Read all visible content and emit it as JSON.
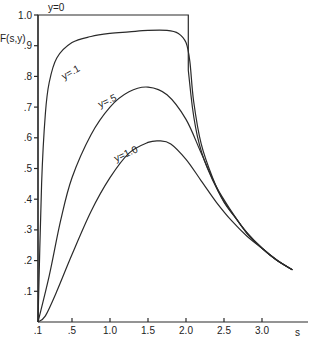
{
  "chart_data": {
    "type": "line",
    "title": "",
    "xlabel": "s",
    "ylabel": "F(s,y)",
    "xlim": [
      0.05,
      3.5
    ],
    "ylim": [
      0,
      1.0
    ],
    "grid": false,
    "legend": "inline curve labels",
    "x_ticks": [
      ".1",
      ".5",
      "1.0",
      "1.5",
      "2.0",
      "2.5",
      "3.0"
    ],
    "x_tick_values": [
      0.05,
      0.5,
      1.0,
      1.5,
      2.0,
      2.5,
      3.0
    ],
    "y_ticks": [
      ".1",
      ".2",
      ".3",
      ".4",
      ".5",
      ".6",
      ".7",
      ".8",
      ".9",
      "1.0"
    ],
    "y_tick_values": [
      0.1,
      0.2,
      0.3,
      0.4,
      0.5,
      0.6,
      0.7,
      0.8,
      0.9,
      1.0
    ],
    "series": [
      {
        "name": "y=0",
        "label": "y=0",
        "x": [
          0.05,
          0.05,
          2.03,
          2.03,
          2.1,
          2.2,
          2.35,
          2.5,
          2.65,
          2.8,
          3.0,
          3.2,
          3.4
        ],
        "values": [
          0.0,
          1.0,
          1.0,
          0.82,
          0.66,
          0.55,
          0.46,
          0.39,
          0.34,
          0.29,
          0.24,
          0.2,
          0.17
        ]
      },
      {
        "name": "y=.1",
        "label": "y=.1",
        "x": [
          0.05,
          0.1,
          0.15,
          0.2,
          0.3,
          0.5,
          0.75,
          1.0,
          1.25,
          1.5,
          1.75,
          1.9,
          2.0,
          2.05,
          2.1,
          2.2,
          2.35,
          2.5,
          2.65,
          2.8,
          3.0,
          3.2,
          3.4
        ],
        "values": [
          0.0,
          0.45,
          0.68,
          0.78,
          0.86,
          0.91,
          0.93,
          0.94,
          0.945,
          0.95,
          0.95,
          0.94,
          0.91,
          0.85,
          0.72,
          0.58,
          0.47,
          0.39,
          0.34,
          0.29,
          0.24,
          0.2,
          0.17
        ]
      },
      {
        "name": "y=.5",
        "label": "y=.5",
        "x": [
          0.05,
          0.2,
          0.35,
          0.5,
          0.75,
          1.0,
          1.25,
          1.5,
          1.75,
          2.0,
          2.2,
          2.4,
          2.6,
          2.8,
          3.0,
          3.2,
          3.4
        ],
        "values": [
          0.0,
          0.15,
          0.33,
          0.47,
          0.61,
          0.7,
          0.75,
          0.765,
          0.74,
          0.66,
          0.55,
          0.44,
          0.36,
          0.29,
          0.24,
          0.2,
          0.17
        ]
      },
      {
        "name": "y=1.0",
        "label": "y=1.0",
        "x": [
          0.05,
          0.15,
          0.3,
          0.5,
          0.75,
          1.0,
          1.25,
          1.5,
          1.65,
          1.8,
          2.0,
          2.2,
          2.4,
          2.6,
          2.8,
          3.0,
          3.2,
          3.4
        ],
        "values": [
          0.0,
          0.02,
          0.1,
          0.22,
          0.36,
          0.47,
          0.55,
          0.585,
          0.59,
          0.58,
          0.53,
          0.46,
          0.39,
          0.33,
          0.28,
          0.24,
          0.2,
          0.17
        ]
      }
    ]
  },
  "labels": {
    "ylabel": "F(s,y)",
    "xlabel": "s",
    "series_y0": "y=0",
    "series_y01": "y=.1",
    "series_y05": "y=.5",
    "series_y10": "y=1.0"
  }
}
